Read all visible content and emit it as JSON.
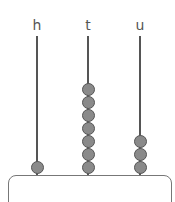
{
  "abacus": {
    "rods": [
      {
        "label": "h",
        "place": "hundreds",
        "beads": 1
      },
      {
        "label": "t",
        "place": "tens",
        "beads": 7
      },
      {
        "label": "u",
        "place": "units",
        "beads": 3
      }
    ],
    "represented_number": 173,
    "bead_color": "#8a8a8a",
    "rod_color": "#555555"
  }
}
